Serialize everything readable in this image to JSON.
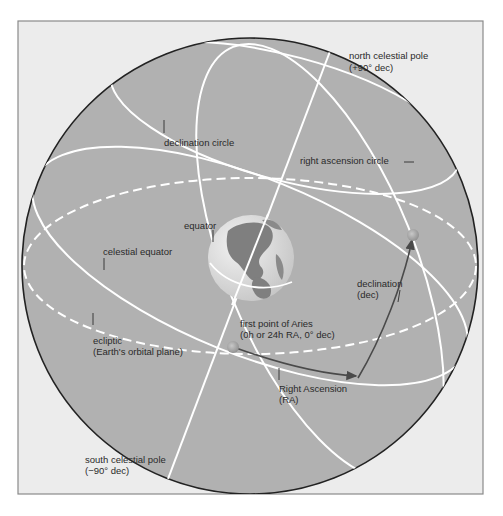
{
  "diagram": {
    "colors": {
      "frame_bg": "#ececec",
      "frame_border": "#8a8a8a",
      "sphere_fill": "#b1b1b1",
      "sphere_outline": "#222222",
      "circle_lines": "#ffffff",
      "arrow": "#4a4a4a",
      "marker": "#9a9a9a",
      "globe_land": "#7f7f7f",
      "globe_ocean": "#dcdcdc"
    },
    "labels": {
      "north_pole_line1": "north celestial pole",
      "north_pole_line2": "(+90° dec)",
      "declination_circle": "declination circle",
      "right_ascension_circle": "right ascension circle",
      "equator": "equator",
      "celestial_equator": "celestial equator",
      "declination_line1": "declination",
      "declination_line2": "(dec)",
      "ecliptic_line1": "ecliptic",
      "ecliptic_line2": "(Earth's orbital plane)",
      "aries_line1": "first point of Aries",
      "aries_line2": "(0h or 24h RA, 0° dec)",
      "ra_line1": "Right Ascension",
      "ra_line2": "(RA)",
      "south_pole_line1": "south celestial pole",
      "south_pole_line2": "(−90° dec)"
    }
  }
}
